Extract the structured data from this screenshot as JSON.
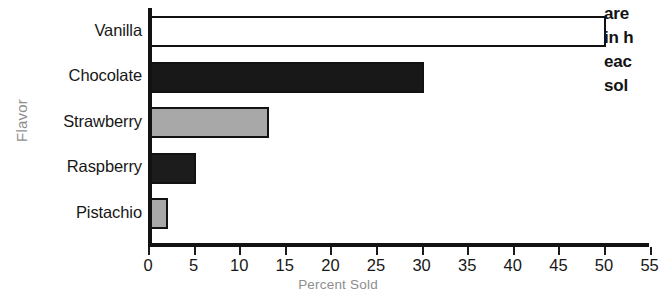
{
  "chart_data": {
    "type": "bar",
    "orientation": "horizontal",
    "title": "Ice Cream Flavors Sold",
    "categories": [
      "Vanilla",
      "Chocolate",
      "Strawberry",
      "Raspberry",
      "Pistachio"
    ],
    "values": [
      50,
      30,
      13,
      5,
      2
    ],
    "xlabel": "Percent Sold",
    "ylabel": "Flavor",
    "xlim": [
      0,
      55
    ],
    "xticks": [
      0,
      5,
      10,
      15,
      20,
      25,
      30,
      35,
      40,
      45,
      50,
      55
    ],
    "xticklabels": [
      "0",
      "5",
      "10",
      "15",
      "20",
      "25",
      "30",
      "35",
      "40",
      "45",
      "50",
      "55"
    ],
    "grid": false,
    "legend": false,
    "bar_colors": [
      "#ffffff",
      "#181818",
      "#a8a8a8",
      "#1c1c1c",
      "#a8a8a8"
    ],
    "bar_edge_color": "#121212",
    "axis_color": "#121212",
    "label_color": "#8e8e8e"
  },
  "caption": {
    "lines": [
      "are",
      "in h",
      "eac",
      "sol"
    ]
  }
}
